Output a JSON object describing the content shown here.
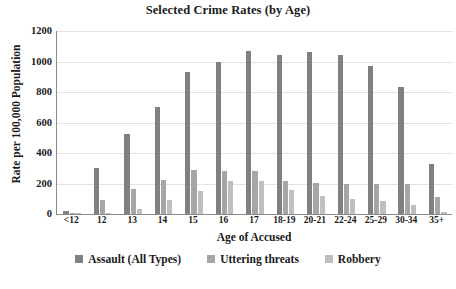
{
  "chart_data": {
    "type": "bar",
    "title": "Selected Crime Rates (by Age)",
    "xlabel": "Age of Accused",
    "ylabel": "Rate per 100,000 Population",
    "ylim": [
      0,
      1200
    ],
    "yticks": [
      0,
      200,
      400,
      600,
      800,
      1000,
      1200
    ],
    "ytick_labels": [
      "0",
      "200",
      "400",
      "600",
      "800",
      "1000",
      "1200"
    ],
    "grid": true,
    "grid_axis": "y",
    "legend_position": "bottom",
    "categories": [
      "<12",
      "12",
      "13",
      "14",
      "15",
      "16",
      "17",
      "18-19",
      "20-21",
      "22-24",
      "25-29",
      "30-34",
      "35+"
    ],
    "series": [
      {
        "name": "Assault (All Types)",
        "color": "#808080",
        "values": [
          20,
          300,
          525,
          705,
          930,
          1000,
          1070,
          1040,
          1065,
          1040,
          970,
          830,
          325
        ]
      },
      {
        "name": "Uttering threats",
        "color": "#a6a6a6",
        "values": [
          8,
          95,
          165,
          220,
          290,
          285,
          285,
          215,
          205,
          195,
          195,
          200,
          110
        ]
      },
      {
        "name": "Robbery",
        "color": "#bfbfbf",
        "values": [
          2,
          5,
          30,
          95,
          150,
          215,
          215,
          160,
          120,
          100,
          85,
          60,
          10
        ]
      }
    ]
  }
}
